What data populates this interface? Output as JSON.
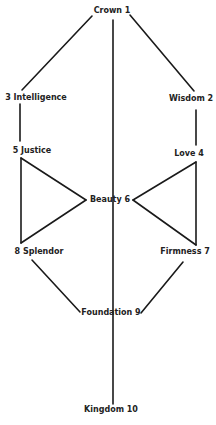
{
  "diagram": {
    "type": "tree-of-life",
    "colors": {
      "background": "#ffffff",
      "line": "#1a1a1a",
      "text": "#222222"
    },
    "nodes": [
      {
        "id": 1,
        "label": "Crown 1",
        "x": 112,
        "y": 11
      },
      {
        "id": 2,
        "label": "Wisdom 2",
        "x": 191,
        "y": 99
      },
      {
        "id": 3,
        "label": "3 Intelligence",
        "x": 36,
        "y": 98
      },
      {
        "id": 4,
        "label": "Love 4",
        "x": 189,
        "y": 154
      },
      {
        "id": 5,
        "label": "5 Justice",
        "x": 32,
        "y": 151
      },
      {
        "id": 6,
        "label": "Beauty 6",
        "x": 110,
        "y": 200
      },
      {
        "id": 7,
        "label": "Firmness 7",
        "x": 185,
        "y": 252
      },
      {
        "id": 8,
        "label": "8 Splendor",
        "x": 39,
        "y": 252
      },
      {
        "id": 9,
        "label": "Foundation 9",
        "x": 111,
        "y": 313
      },
      {
        "id": 10,
        "label": "Kingdom 10",
        "x": 111,
        "y": 410
      }
    ],
    "edges": [
      {
        "from": 1,
        "to": 3,
        "x1": 92,
        "y1": 16,
        "x2": 22,
        "y2": 90
      },
      {
        "from": 1,
        "to": 2,
        "x1": 130,
        "y1": 15,
        "x2": 194,
        "y2": 91
      },
      {
        "from": 1,
        "to": 10,
        "x1": 113,
        "y1": 20,
        "x2": 113,
        "y2": 404
      },
      {
        "from": 3,
        "to": 5,
        "x1": 20,
        "y1": 104,
        "x2": 20,
        "y2": 141
      },
      {
        "from": 2,
        "to": 4,
        "x1": 196,
        "y1": 110,
        "x2": 196,
        "y2": 145
      },
      {
        "from": 5,
        "to": 6,
        "x1": 21,
        "y1": 158,
        "x2": 86,
        "y2": 200
      },
      {
        "from": 6,
        "to": 8,
        "x1": 86,
        "y1": 200,
        "x2": 21,
        "y2": 243
      },
      {
        "from": 5,
        "to": 8,
        "x1": 21,
        "y1": 158,
        "x2": 21,
        "y2": 243
      },
      {
        "from": 4,
        "to": 6,
        "x1": 196,
        "y1": 162,
        "x2": 133,
        "y2": 200
      },
      {
        "from": 6,
        "to": 7,
        "x1": 133,
        "y1": 200,
        "x2": 196,
        "y2": 245
      },
      {
        "from": 4,
        "to": 7,
        "x1": 196,
        "y1": 162,
        "x2": 196,
        "y2": 245
      },
      {
        "from": 8,
        "to": 9,
        "x1": 32,
        "y1": 260,
        "x2": 80,
        "y2": 312
      },
      {
        "from": 7,
        "to": 9,
        "x1": 183,
        "y1": 262,
        "x2": 141,
        "y2": 313
      }
    ]
  }
}
